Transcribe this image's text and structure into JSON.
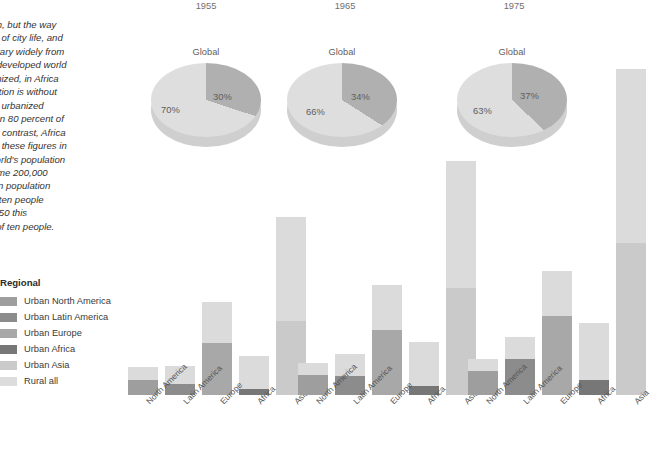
{
  "article": {
    "heading": "e world",
    "body": "nomenon, but the way\nperience of city life, and\nof cites vary widely from\nn of the developed world\nely urbanized, in Africa\nurbanization is without\nthe most urbanized\nmore than 80 percent of\nareas. In contrast, Africa\nn. To put these figures in\nof the world's population\nently, some 200,000\nld's urban population\nof every ten people\nnd by 2050 this\nven out of ten people."
  },
  "legend": {
    "title": "Regional",
    "items": [
      {
        "label": "Urban North America",
        "color": "#9e9e9e"
      },
      {
        "label": "Urban Latin America",
        "color": "#8c8c8c"
      },
      {
        "label": "Urban Europe",
        "color": "#a8a8a8"
      },
      {
        "label": "Urban Africa",
        "color": "#777777"
      },
      {
        "label": "Urban Asia",
        "color": "#cacaca"
      },
      {
        "label": "Rural all",
        "color": "#dcdcdc"
      }
    ]
  },
  "chart_data": [
    {
      "type": "pie",
      "title": "Global",
      "year": "1955",
      "labels": [
        "Urban",
        "Rural"
      ],
      "values": [
        30,
        70
      ],
      "value_labels": [
        "30%",
        "70%"
      ],
      "colors": [
        "#b0b0b0",
        "#dedede"
      ]
    },
    {
      "type": "pie",
      "title": "Global",
      "year": "1965",
      "labels": [
        "Urban",
        "Rural"
      ],
      "values": [
        34,
        66
      ],
      "value_labels": [
        "34%",
        "66%"
      ],
      "colors": [
        "#b0b0b0",
        "#dedede"
      ]
    },
    {
      "type": "pie",
      "title": "Global",
      "year": "1975",
      "labels": [
        "Urban",
        "Rural"
      ],
      "values": [
        37,
        63
      ],
      "value_labels": [
        "37%",
        "63%"
      ],
      "colors": [
        "#b0b0b0",
        "#dedede"
      ]
    },
    {
      "type": "bar",
      "stacked": true,
      "year": "1955",
      "title": "",
      "xlabel": "",
      "ylabel": "",
      "categories": [
        "North America",
        "Latin America",
        "Europe",
        "Africa",
        "Asia"
      ],
      "series": [
        {
          "name": "Urban",
          "values": [
            12,
            9,
            41,
            5,
            58
          ]
        },
        {
          "name": "Rural",
          "values": [
            10,
            14,
            32,
            26,
            82
          ]
        }
      ],
      "urban_colors": [
        "#9e9e9e",
        "#8c8c8c",
        "#a8a8a8",
        "#777777",
        "#cacaca"
      ],
      "rural_color": "#dbdbdb"
    },
    {
      "type": "bar",
      "stacked": true,
      "year": "1965",
      "title": "",
      "xlabel": "",
      "ylabel": "",
      "categories": [
        "North America",
        "Latin America",
        "Europe",
        "Africa",
        "Asia"
      ],
      "series": [
        {
          "name": "Urban",
          "values": [
            16,
            15,
            51,
            7,
            84
          ]
        },
        {
          "name": "Rural",
          "values": [
            9,
            17,
            36,
            35,
            100
          ]
        }
      ],
      "urban_colors": [
        "#9e9e9e",
        "#8c8c8c",
        "#a8a8a8",
        "#777777",
        "#cacaca"
      ],
      "rural_color": "#dbdbdb"
    },
    {
      "type": "bar",
      "stacked": true,
      "year": "1975",
      "title": "",
      "xlabel": "",
      "ylabel": "",
      "categories": [
        "North America",
        "Latin America",
        "Europe",
        "Africa",
        "Asia"
      ],
      "series": [
        {
          "name": "Urban",
          "values": [
            19,
            28,
            62,
            12,
            120
          ]
        },
        {
          "name": "Rural",
          "values": [
            9,
            18,
            36,
            45,
            137
          ]
        }
      ],
      "urban_colors": [
        "#9e9e9e",
        "#8c8c8c",
        "#a8a8a8",
        "#777777",
        "#cacaca"
      ],
      "rural_color": "#dbdbdb"
    }
  ],
  "years": [
    "1955",
    "1965",
    "1975"
  ]
}
